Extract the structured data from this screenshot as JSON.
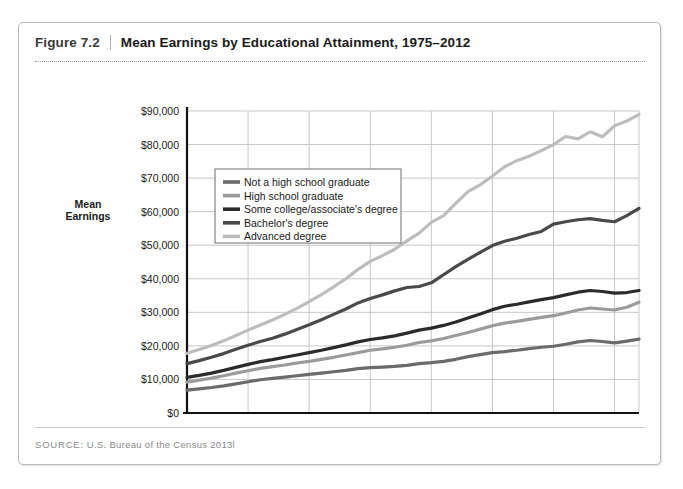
{
  "figure": {
    "number": "Figure 7.2",
    "title": "Mean Earnings by Educational Attainment, 1975–2012",
    "source_label": "SOURCE:",
    "source_text": "U.S. Bureau of the Census 2013l"
  },
  "chart_data": {
    "type": "line",
    "title": "Mean Earnings by Educational Attainment, 1975–2012",
    "xlabel": "",
    "ylabel": "Mean Earnings",
    "ylabel_lines": [
      "Mean",
      "Earnings"
    ],
    "xlim": [
      1975,
      2012
    ],
    "ylim": [
      0,
      90000
    ],
    "grid": true,
    "legend_position": "top-left-inside",
    "xticks": [
      1975,
      1980,
      1985,
      1990,
      1995,
      2000,
      2005,
      2010,
      2012
    ],
    "xtick_labels": [
      "1975",
      "1980",
      "1985",
      "1990",
      "1995",
      "2000",
      "2005",
      "2010",
      "2012"
    ],
    "yticks": [
      0,
      10000,
      20000,
      30000,
      40000,
      50000,
      60000,
      70000,
      80000,
      90000
    ],
    "ytick_labels": [
      "$0",
      "$10,000",
      "$20,000",
      "$30,000",
      "$40,000",
      "$50,000",
      "$60,000",
      "$70,000",
      "$80,000",
      "$90,000"
    ],
    "x": [
      1975,
      1976,
      1977,
      1978,
      1979,
      1980,
      1981,
      1982,
      1983,
      1984,
      1985,
      1986,
      1987,
      1988,
      1989,
      1990,
      1991,
      1992,
      1993,
      1994,
      1995,
      1996,
      1997,
      1998,
      1999,
      2000,
      2001,
      2002,
      2003,
      2004,
      2005,
      2006,
      2007,
      2008,
      2009,
      2010,
      2011,
      2012
    ],
    "series": [
      {
        "name": "Not a high school graduate",
        "color": "#6b6b6b",
        "values": [
          6800,
          7200,
          7600,
          8100,
          8700,
          9300,
          9900,
          10300,
          10700,
          11100,
          11500,
          11900,
          12300,
          12700,
          13200,
          13500,
          13700,
          13900,
          14200,
          14700,
          15000,
          15400,
          16000,
          16800,
          17400,
          18000,
          18300,
          18700,
          19200,
          19600,
          19900,
          20500,
          21200,
          21600,
          21300,
          20900,
          21400,
          22000
        ]
      },
      {
        "name": "High school graduate",
        "color": "#9b9b9b",
        "values": [
          9200,
          9800,
          10400,
          11100,
          11900,
          12600,
          13300,
          13800,
          14300,
          14900,
          15400,
          16000,
          16600,
          17300,
          18000,
          18700,
          19100,
          19600,
          20200,
          21000,
          21500,
          22200,
          23100,
          24000,
          25000,
          26000,
          26800,
          27300,
          27900,
          28500,
          29000,
          29800,
          30700,
          31300,
          31000,
          30700,
          31500,
          33000
        ]
      },
      {
        "name": "Some college/associate's degree",
        "color": "#2b2b2b",
        "values": [
          10600,
          11200,
          11900,
          12700,
          13600,
          14500,
          15300,
          15900,
          16600,
          17300,
          18000,
          18700,
          19500,
          20300,
          21200,
          21900,
          22400,
          23000,
          23800,
          24700,
          25300,
          26100,
          27100,
          28300,
          29500,
          30800,
          31800,
          32400,
          33100,
          33800,
          34400,
          35200,
          36000,
          36500,
          36200,
          35700,
          35900,
          36500
        ]
      },
      {
        "name": "Bachelor's degree",
        "color": "#4a4a4a",
        "values": [
          14700,
          15600,
          16600,
          17700,
          19000,
          20200,
          21300,
          22300,
          23500,
          24900,
          26300,
          27800,
          29400,
          31000,
          32800,
          34100,
          35200,
          36400,
          37400,
          37700,
          38800,
          41200,
          43600,
          45800,
          47900,
          49900,
          51200,
          52100,
          53200,
          54100,
          56300,
          57000,
          57600,
          57900,
          57400,
          57000,
          58800,
          61000
        ]
      },
      {
        "name": "Advanced degree",
        "color": "#bdbdbd",
        "values": [
          17800,
          18900,
          20100,
          21500,
          23100,
          24700,
          26200,
          27700,
          29400,
          31200,
          33200,
          35300,
          37600,
          40000,
          42800,
          45200,
          46900,
          48800,
          51300,
          53600,
          56800,
          58800,
          62500,
          66000,
          68000,
          70600,
          73400,
          75200,
          76500,
          78200,
          80000,
          82400,
          81700,
          83800,
          82300,
          85600,
          87000,
          89000
        ]
      }
    ]
  },
  "legend": {
    "items": [
      {
        "label": "Not a high school graduate",
        "swatch": "#6b6b6b"
      },
      {
        "label": "High school graduate",
        "swatch": "#9b9b9b"
      },
      {
        "label": "Some college/associate's degree",
        "swatch": "#2b2b2b"
      },
      {
        "label": "Bachelor's degree",
        "swatch": "#4a4a4a"
      },
      {
        "label": "Advanced degree",
        "swatch": "#bdbdbd"
      }
    ]
  }
}
